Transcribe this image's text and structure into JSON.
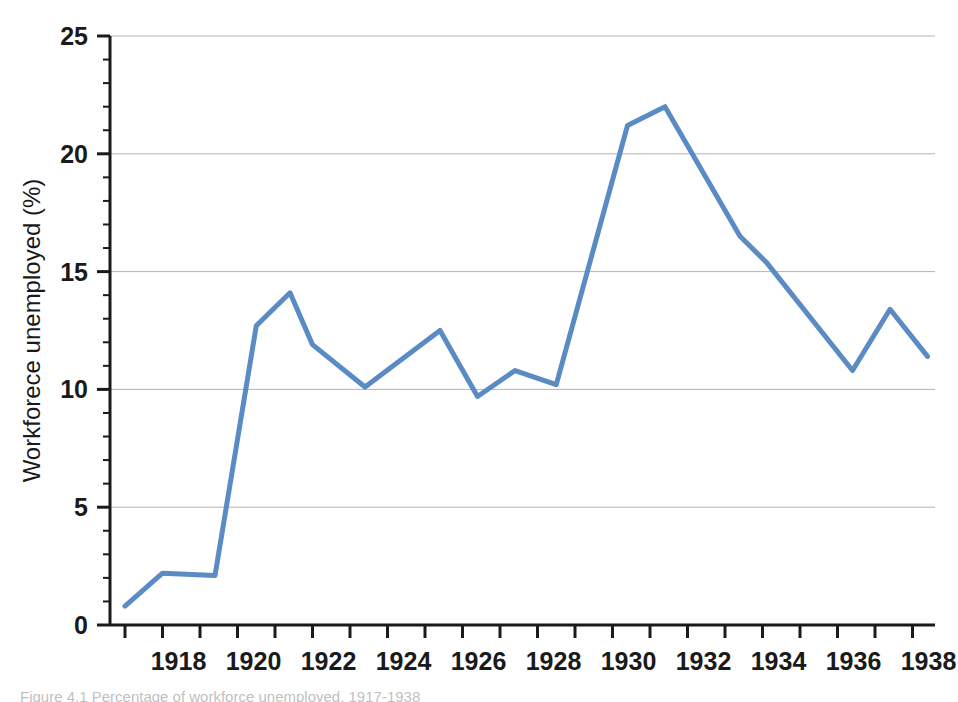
{
  "figure": {
    "background_color": "#ffffff",
    "line_color": "#5b8bc4",
    "axis_color": "#1a1a1a",
    "grid_color": "#b3b3b3",
    "caption_text": "Figure 4.1  Percentage of workforce unemployed, 1917-1938"
  },
  "axes": {
    "y_title": "Workforece unemployed (%)",
    "x_title": "",
    "y_ticks": [
      0,
      5,
      10,
      15,
      20,
      25
    ],
    "y_tick_labels": [
      "0",
      "5",
      "10",
      "15",
      "20",
      "25"
    ],
    "y_minor_ticks": [
      1,
      2,
      3,
      4,
      6,
      7,
      8,
      9,
      11,
      12,
      13,
      14,
      16,
      17,
      18,
      19,
      21,
      22,
      23,
      24
    ],
    "x_ticks": [
      1917,
      1918,
      1919,
      1920,
      1921,
      1922,
      1923,
      1924,
      1925,
      1926,
      1927,
      1928,
      1929,
      1930,
      1931,
      1932,
      1933,
      1934,
      1935,
      1936,
      1937,
      1938
    ],
    "x_tick_labels_shown": [
      "1918",
      "1920",
      "1922",
      "1924",
      "1926",
      "1928",
      "1930",
      "1932",
      "1934",
      "1936",
      "1938"
    ],
    "xlim": [
      1916.6,
      1938.6
    ],
    "ylim": [
      0,
      25
    ],
    "grid": "horizontal-major"
  },
  "chart_data": {
    "type": "line",
    "title": "",
    "xlabel": "",
    "ylabel": "Workforece unemployed (%)",
    "xlim": [
      1916.6,
      1938.6
    ],
    "ylim": [
      0,
      25
    ],
    "grid": true,
    "legend": "none",
    "series": [
      {
        "name": "Workforce unemployed",
        "color": "#5b8bc4",
        "x": [
          1917.0,
          1918.0,
          1919.4,
          1920.5,
          1921.4,
          1922.0,
          1923.4,
          1925.4,
          1926.4,
          1927.4,
          1928.5,
          1930.4,
          1931.4,
          1933.4,
          1934.1,
          1936.4,
          1937.4,
          1938.4
        ],
        "y": [
          0.8,
          2.2,
          2.1,
          12.7,
          14.1,
          11.9,
          10.1,
          12.5,
          9.7,
          10.8,
          10.2,
          21.2,
          22.0,
          16.5,
          15.4,
          10.8,
          13.4,
          11.4
        ]
      }
    ]
  }
}
